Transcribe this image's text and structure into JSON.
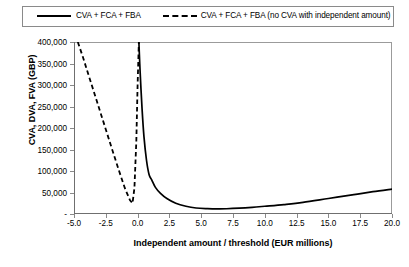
{
  "legend": {
    "position": "top",
    "entries": [
      {
        "label": "CVA + FCA + FBA",
        "style": "solid"
      },
      {
        "label": "CVA + FCA + FBA (no CVA with independent amount)",
        "style": "dashed"
      }
    ]
  },
  "axes": {
    "ylabel": "CVA, DVA, FVA (GBP)",
    "xlabel": "Independent amount / threshold (EUR millions)",
    "yticks": [
      "400,000",
      "350,000",
      "300,000",
      "250,000",
      "200,000",
      "150,000",
      "100,000",
      "50,000",
      "-"
    ],
    "ytick_values": [
      400000,
      350000,
      300000,
      250000,
      200000,
      150000,
      100000,
      50000,
      0
    ],
    "xticks": [
      "-5.0",
      "-2.5",
      "0.0",
      "2.5",
      "5.0",
      "7.5",
      "10.0",
      "12.5",
      "15.0",
      "17.5",
      "20.0"
    ],
    "xtick_values": [
      -5.0,
      -2.5,
      0.0,
      2.5,
      5.0,
      7.5,
      10.0,
      12.5,
      15.0,
      17.5,
      20.0
    ]
  },
  "caption": "",
  "chart_data": {
    "type": "line",
    "title": "",
    "xlabel": "Independent amount / threshold (EUR millions)",
    "ylabel": "CVA, DVA, FVA (GBP)",
    "xlim": [
      -5.0,
      20.0
    ],
    "ylim": [
      0,
      400000
    ],
    "grid": false,
    "legend_position": "top",
    "series": [
      {
        "name": "CVA + FCA + FBA",
        "style": "solid",
        "color": "#000000",
        "x": [
          0.1,
          0.2,
          0.35,
          0.5,
          0.7,
          0.9,
          1.1,
          1.4,
          1.8,
          2.3,
          3.0,
          3.8,
          4.6,
          5.5,
          6.3,
          7.0,
          8.0,
          9.0,
          10.0,
          11.5,
          13.0,
          15.0,
          17.0,
          18.5,
          20.0
        ],
        "y": [
          400000,
          330000,
          245000,
          180000,
          125000,
          92000,
          80000,
          62000,
          48000,
          36000,
          25000,
          18000,
          14000,
          12500,
          12000,
          12200,
          13500,
          15500,
          18000,
          22000,
          27000,
          36000,
          45000,
          52000,
          58000
        ]
      },
      {
        "name": "CVA + FCA + FBA (no CVA with independent amount)",
        "style": "dashed",
        "color": "#000000",
        "x": [
          -4.7,
          -4.3,
          -3.8,
          -3.2,
          -2.6,
          -2.0,
          -1.5,
          -1.0,
          -0.6,
          -0.4,
          -0.25,
          -0.1,
          0.0,
          0.1
        ],
        "y": [
          400000,
          365000,
          318000,
          262000,
          206000,
          150000,
          104000,
          60000,
          32000,
          25000,
          60000,
          170000,
          300000,
          400000
        ]
      }
    ]
  }
}
